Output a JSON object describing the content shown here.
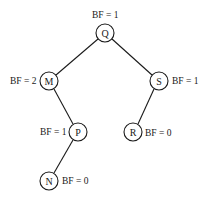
{
  "diagram": {
    "type": "binary-tree",
    "nodes": {
      "Q": {
        "label": "Q",
        "bf": "BF = 1",
        "x": 105,
        "y": 33
      },
      "M": {
        "label": "M",
        "bf": "BF = 2",
        "x": 49,
        "y": 81
      },
      "S": {
        "label": "S",
        "bf": "BF = 1",
        "x": 159,
        "y": 81
      },
      "P": {
        "label": "P",
        "bf": "BF = 1",
        "x": 78,
        "y": 132
      },
      "R": {
        "label": "R",
        "bf": "BF = 0",
        "x": 133,
        "y": 132
      },
      "N": {
        "label": "N",
        "bf": "BF = 0",
        "x": 49,
        "y": 181
      }
    },
    "edges": [
      [
        "Q",
        "M"
      ],
      [
        "Q",
        "S"
      ],
      [
        "M",
        "P"
      ],
      [
        "S",
        "R"
      ],
      [
        "P",
        "N"
      ]
    ]
  }
}
